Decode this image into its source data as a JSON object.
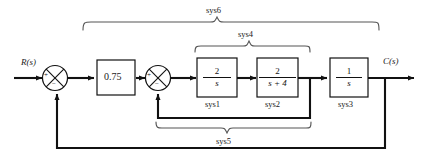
{
  "diagram": {
    "input_label": "R(s)",
    "output_label": "C(s)",
    "gain_block": {
      "value": "0.75"
    },
    "blocks": [
      {
        "name": "sys1",
        "numerator": "2",
        "denominator": "s",
        "label": "sys1"
      },
      {
        "name": "sys2",
        "numerator": "2",
        "denominator": "s + 4",
        "label": "sys2"
      },
      {
        "name": "sys3",
        "numerator": "1",
        "denominator": "s",
        "label": "sys3"
      }
    ],
    "summing_junctions": [
      {
        "name": "summer-1",
        "plus": "+",
        "minus": "−"
      },
      {
        "name": "summer-2",
        "plus": "+",
        "minus": "−"
      }
    ],
    "braces": [
      {
        "name": "sys6",
        "label": "sys6",
        "position": "top-outer"
      },
      {
        "name": "sys4",
        "label": "sys4",
        "position": "top-inner"
      },
      {
        "name": "sys5",
        "label": "sys5",
        "position": "bottom"
      }
    ],
    "colors": {
      "line": "#111111",
      "brace": "#555555",
      "background": "#ffffff"
    }
  }
}
